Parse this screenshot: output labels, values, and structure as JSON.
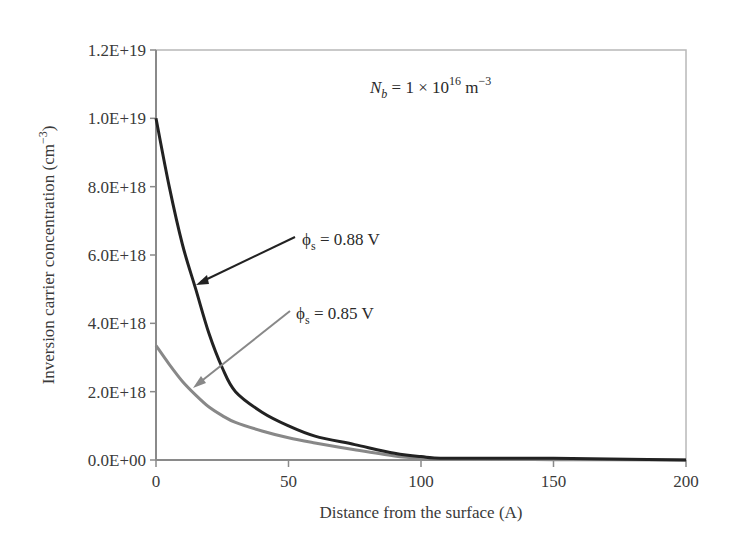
{
  "chart_data": {
    "type": "line",
    "title": "",
    "annotation_top": "N_b = 1 × 10^16 m^-3",
    "xlabel": "Distance from the surface (A)",
    "ylabel": "Inversion carrier concentration (cm^-3)",
    "xlim": [
      0,
      200
    ],
    "ylim": [
      0,
      1.2e+19
    ],
    "xticks": [
      "0",
      "50",
      "100",
      "150",
      "200"
    ],
    "yticks": [
      "0.0E+00",
      "2.0E+18",
      "4.0E+18",
      "6.0E+18",
      "8.0E+18",
      "1.0E+19",
      "1.2E+19"
    ],
    "grid": false,
    "legend": "none (arrow annotations)",
    "series": [
      {
        "name": "φs = 0.88 V",
        "color": "#222222",
        "x": [
          0,
          5,
          10,
          15,
          20,
          25,
          30,
          40,
          50,
          60,
          75,
          90,
          100,
          110,
          150,
          200
        ],
        "y": [
          1e+19,
          8e+18,
          6.3e+18,
          5e+18,
          3.7e+18,
          2.7e+18,
          2e+18,
          1.4e+18,
          1e+18,
          7e+17,
          4.5e+17,
          2e+17,
          1e+17,
          5e+16,
          5e+16,
          0
        ]
      },
      {
        "name": "φs = 0.85 V",
        "color": "#888888",
        "x": [
          0,
          5,
          10,
          15,
          20,
          25,
          30,
          40,
          50,
          60,
          75,
          90,
          100,
          110,
          150,
          200
        ],
        "y": [
          3.35e+18,
          2.8e+18,
          2.3e+18,
          1.9e+18,
          1.55e+18,
          1.3e+18,
          1.1e+18,
          8.5e+17,
          6.5e+17,
          5e+17,
          3e+17,
          1.2e+17,
          5e+16,
          2e+16,
          1e+16,
          0
        ]
      }
    ]
  },
  "labels": {
    "top_annotation_main": "N",
    "top_annotation_sub": "b",
    "top_annotation_rest": " = 1 × 10",
    "top_annotation_exp": "16",
    "top_annotation_unit": " m",
    "top_annotation_unit_exp": "−3",
    "ann_088_phi": "ϕ",
    "ann_088_sub": "s",
    "ann_088_rest": " = 0.88 V",
    "ann_085_phi": "ϕ",
    "ann_085_sub": "s",
    "ann_085_rest": " = 0.85 V",
    "xlabel": "Distance from the surface (A)",
    "ylabel_main": "Inversion carrier concentration (cm",
    "ylabel_exp": "−3",
    "ylabel_close": ")",
    "xticks": [
      "0",
      "50",
      "100",
      "150",
      "200"
    ],
    "yticks": [
      "0.0E+00",
      "2.0E+18",
      "4.0E+18",
      "6.0E+18",
      "8.0E+18",
      "1.0E+19",
      "1.2E+19"
    ]
  }
}
